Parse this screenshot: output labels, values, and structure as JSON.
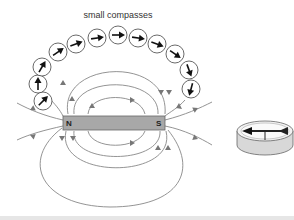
{
  "diagram": {
    "title": "small compasses",
    "magnet": {
      "north_label": "N",
      "south_label": "S",
      "color": "#a8a8a8"
    },
    "field_line_color": "#777777",
    "compasses": [
      {
        "cx": 43,
        "cy": 101,
        "angle": -45
      },
      {
        "cx": 38,
        "cy": 84,
        "angle": -90
      },
      {
        "cx": 42,
        "cy": 67,
        "angle": -60
      },
      {
        "cx": 58,
        "cy": 52,
        "angle": -35
      },
      {
        "cx": 76,
        "cy": 44,
        "angle": -20
      },
      {
        "cx": 97,
        "cy": 38,
        "angle": -8
      },
      {
        "cx": 118,
        "cy": 35,
        "angle": 0
      },
      {
        "cx": 138,
        "cy": 38,
        "angle": 8
      },
      {
        "cx": 157,
        "cy": 44,
        "angle": 20
      },
      {
        "cx": 175,
        "cy": 54,
        "angle": 35
      },
      {
        "cx": 189,
        "cy": 70,
        "angle": 70
      },
      {
        "cx": 191,
        "cy": 89,
        "angle": 105
      }
    ],
    "side_compass": {
      "label": "compass (3D view)"
    }
  }
}
